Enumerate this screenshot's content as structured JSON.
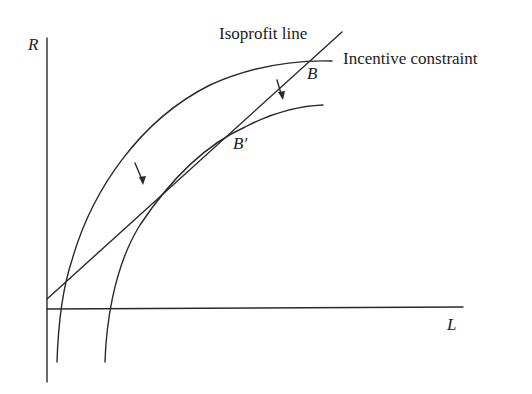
{
  "diagram": {
    "axes": {
      "y_label": "R",
      "x_label": "L"
    },
    "labels": {
      "isoprofit": "Isoprofit line",
      "incentive": "Incentive constraint",
      "point_b": "B",
      "point_b_prime": "B′"
    },
    "colors": {
      "stroke": "#2a2a2a",
      "background": "#ffffff"
    }
  }
}
